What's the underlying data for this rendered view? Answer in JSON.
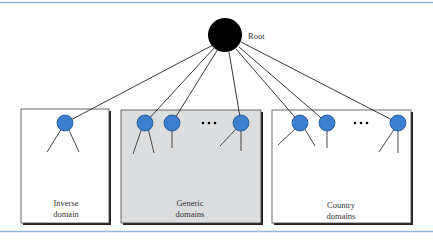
{
  "diagram": {
    "root": {
      "label": "Root"
    },
    "colors": {
      "rule": "#8fb5d8",
      "node": "#3a7fd0",
      "node_stroke": "#1d4f8c",
      "root": "#000000",
      "generic_fill": "#dcdddf",
      "box_fill": "#ffffff"
    },
    "domains": [
      {
        "id": "inverse",
        "label_line1": "Inverse",
        "label_line2": "domain",
        "shaded": false
      },
      {
        "id": "generic",
        "label_line1": "Generic",
        "label_line2": "domains",
        "shaded": true
      },
      {
        "id": "country",
        "label_line1": "Country",
        "label_line2": "domains",
        "shaded": false
      }
    ],
    "ellipsis": "•••"
  }
}
